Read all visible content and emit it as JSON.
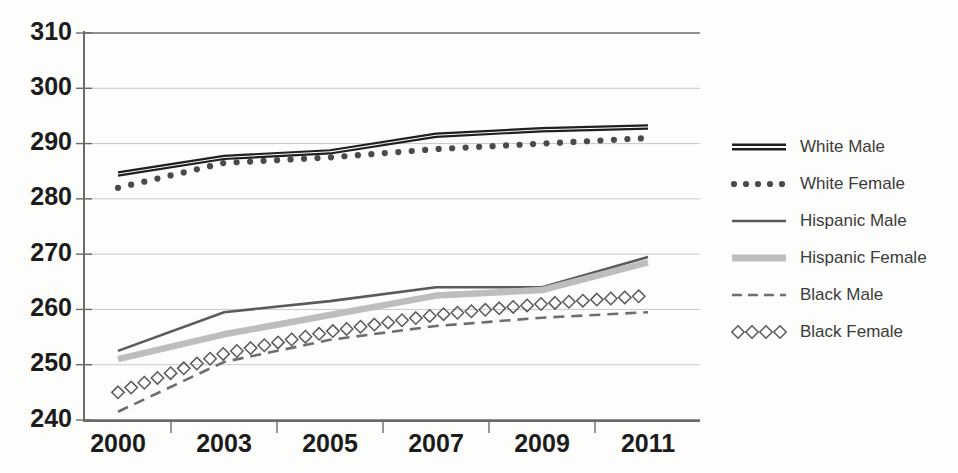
{
  "chart_data": {
    "type": "line",
    "title": "",
    "xlabel": "",
    "ylabel": "",
    "categories": [
      "2000",
      "2003",
      "2005",
      "2007",
      "2009",
      "2011"
    ],
    "ylim": [
      240,
      310
    ],
    "yticks": [
      240,
      250,
      260,
      270,
      280,
      290,
      300,
      310
    ],
    "grid": true,
    "legend_position": "right",
    "series": [
      {
        "name": "White Male",
        "style": "double-solid",
        "color": "#1f1f1f",
        "values": [
          284.5,
          287.5,
          288.5,
          291.5,
          292.5,
          293.0
        ]
      },
      {
        "name": "White Female",
        "style": "dotted",
        "color": "#4a4a4a",
        "values": [
          282.0,
          286.5,
          287.5,
          289.0,
          290.0,
          291.0
        ]
      },
      {
        "name": "Hispanic Male",
        "style": "solid",
        "color": "#5a5a5a",
        "values": [
          252.5,
          259.5,
          261.5,
          264.0,
          264.0,
          269.5
        ]
      },
      {
        "name": "Hispanic Female",
        "style": "thick-light",
        "color": "#bdbdbd",
        "values": [
          251.0,
          255.5,
          259.0,
          262.5,
          263.5,
          268.5
        ]
      },
      {
        "name": "Black Male",
        "style": "dashed",
        "color": "#6e6e6e",
        "values": [
          241.5,
          250.5,
          254.5,
          257.0,
          258.5,
          259.5
        ]
      },
      {
        "name": "Black Female",
        "style": "diamonds",
        "color": "#5a5a5a",
        "values": [
          245.0,
          252.0,
          256.0,
          259.0,
          261.0,
          262.5
        ]
      }
    ]
  },
  "axis": {
    "ytick_labels": [
      "310",
      "300",
      "290",
      "280",
      "270",
      "260",
      "250",
      "240"
    ],
    "xtick_labels": [
      "2000",
      "2003",
      "2005",
      "2007",
      "2009",
      "2011"
    ]
  },
  "legend": {
    "items": [
      {
        "label": "White Male",
        "marker": "double-solid-marker"
      },
      {
        "label": "White Female",
        "marker": "dotted-marker"
      },
      {
        "label": "Hispanic Male",
        "marker": "solid-marker"
      },
      {
        "label": "Hispanic Female",
        "marker": "thick-light-marker"
      },
      {
        "label": "Black Male",
        "marker": "dashed-marker"
      },
      {
        "label": "Black Female",
        "marker": "diamonds-marker"
      }
    ]
  },
  "colors": {
    "axis": "#6b6b6b",
    "grid": "#c9c9c9",
    "text": "#1c1c1c",
    "legend_text": "#3b3b3b",
    "background": "#fdfdfc"
  }
}
